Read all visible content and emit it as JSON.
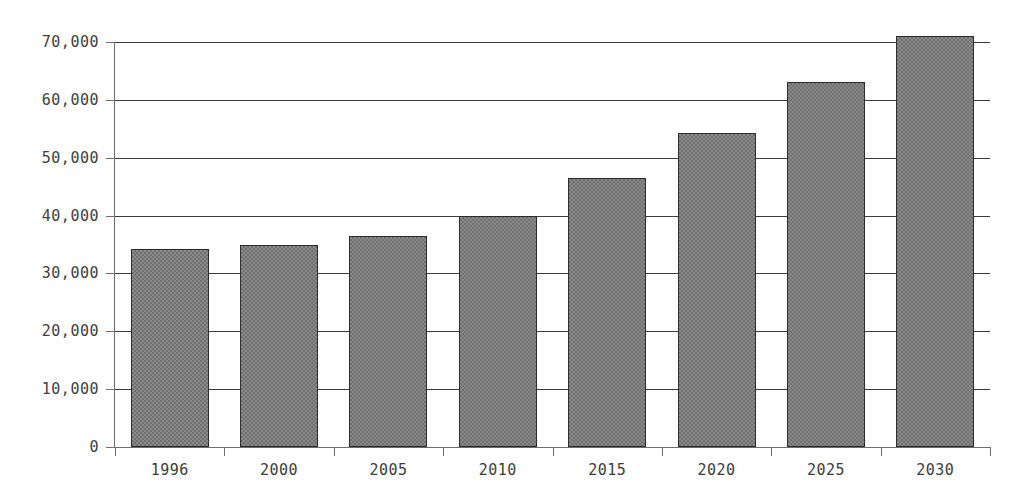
{
  "chart_data": {
    "type": "bar",
    "title": "",
    "subtitle": "",
    "xlabel": "",
    "ylabel": "",
    "categories": [
      "1996",
      "2000",
      "2005",
      "2010",
      "2015",
      "2020",
      "2025",
      "2030"
    ],
    "values": [
      34200,
      34900,
      36500,
      39900,
      46500,
      54300,
      63100,
      71000
    ],
    "series": [
      {
        "name": "",
        "values": [
          34200,
          34900,
          36500,
          39900,
          46500,
          54300,
          63100,
          71000
        ]
      }
    ],
    "ylim": [
      0,
      71500
    ],
    "xlim": [
      0,
      8
    ],
    "yticks": [
      0,
      10000,
      20000,
      30000,
      40000,
      50000,
      60000,
      70000
    ],
    "ytick_labels": [
      "0",
      "10,000",
      "20,000",
      "30,000",
      "40,000",
      "50,000",
      "60,000",
      "70,000"
    ],
    "xtick_labels": [
      "1996",
      "2000",
      "2005",
      "2010",
      "2015",
      "2020",
      "2025",
      "2030"
    ],
    "grid": "horizontal",
    "legend": "none",
    "annotations": [],
    "colors": {
      "bar_fill": "#8a8a8a",
      "bar_pattern": "#6f6f6f",
      "bar_border": "#2b2b2b",
      "gridline": "#3c3c3c",
      "axis": "#6e6e6e",
      "tick_text": "#404040",
      "background": "#ffffff"
    }
  }
}
